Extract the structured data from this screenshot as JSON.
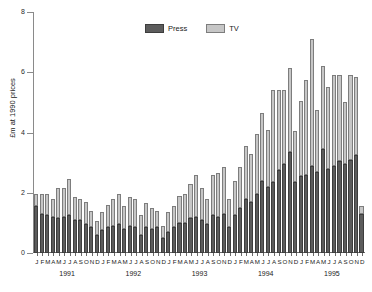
{
  "chart_data": {
    "type": "bar",
    "stacked": true,
    "title": "",
    "xlabel": "",
    "ylabel": "£m at 1990 prices",
    "ylim": [
      0,
      8
    ],
    "yticks": [
      0,
      2,
      4,
      6,
      8
    ],
    "grid": false,
    "legend_position": "top-center",
    "months": [
      "J",
      "F",
      "M",
      "A",
      "M",
      "J",
      "J",
      "A",
      "S",
      "O",
      "N",
      "D"
    ],
    "years": [
      "1991",
      "1992",
      "1993",
      "1994",
      "1995"
    ],
    "categories": [
      "1991-J",
      "1991-F",
      "1991-M",
      "1991-A",
      "1991-M",
      "1991-J",
      "1991-J",
      "1991-A",
      "1991-S",
      "1991-O",
      "1991-N",
      "1991-D",
      "1992-J",
      "1992-F",
      "1992-M",
      "1992-A",
      "1992-M",
      "1992-J",
      "1992-J",
      "1992-A",
      "1992-S",
      "1992-O",
      "1992-N",
      "1992-D",
      "1993-J",
      "1993-F",
      "1993-M",
      "1993-A",
      "1993-M",
      "1993-J",
      "1993-J",
      "1993-A",
      "1993-S",
      "1993-O",
      "1993-N",
      "1993-D",
      "1994-J",
      "1994-F",
      "1994-M",
      "1994-A",
      "1994-M",
      "1994-J",
      "1994-J",
      "1994-A",
      "1994-S",
      "1994-O",
      "1994-N",
      "1994-D",
      "1995-J",
      "1995-F",
      "1995-M",
      "1995-A",
      "1995-M",
      "1995-J",
      "1995-J",
      "1995-A",
      "1995-S",
      "1995-O",
      "1995-N",
      "1995-D"
    ],
    "series": [
      {
        "name": "Press",
        "color": "#5c5c5c",
        "values": [
          1.55,
          1.3,
          1.25,
          1.2,
          1.15,
          1.2,
          1.25,
          1.1,
          1.1,
          0.95,
          0.85,
          0.6,
          0.75,
          0.85,
          0.9,
          0.95,
          0.8,
          0.9,
          0.85,
          0.6,
          0.85,
          0.8,
          0.85,
          0.5,
          0.7,
          0.85,
          1.0,
          1.0,
          1.15,
          1.2,
          1.1,
          0.95,
          1.25,
          1.2,
          1.3,
          0.85,
          1.25,
          1.5,
          1.8,
          1.7,
          1.95,
          2.4,
          2.2,
          2.35,
          2.75,
          2.95,
          3.35,
          2.35,
          2.55,
          2.6,
          2.9,
          2.7,
          3.45,
          2.8,
          2.9,
          3.05,
          2.95,
          3.1,
          3.25,
          1.3
        ]
      },
      {
        "name": "TV",
        "color": "#c6c6c6",
        "values": [
          0.4,
          0.65,
          0.7,
          0.6,
          1.0,
          0.95,
          1.2,
          0.75,
          0.7,
          0.75,
          0.55,
          0.45,
          0.6,
          0.75,
          0.9,
          1.0,
          0.75,
          0.95,
          0.95,
          0.65,
          0.8,
          0.7,
          0.55,
          0.4,
          0.65,
          0.7,
          0.9,
          0.95,
          1.15,
          1.4,
          1.05,
          0.85,
          1.35,
          1.45,
          1.55,
          0.95,
          1.15,
          1.35,
          1.75,
          1.6,
          2.0,
          2.25,
          1.9,
          3.05,
          2.65,
          2.45,
          2.8,
          1.7,
          2.5,
          3.15,
          4.2,
          2.05,
          2.75,
          2.7,
          3.0,
          2.85,
          2.05,
          2.8,
          2.6,
          0.25
        ]
      }
    ]
  },
  "legend": {
    "items": [
      {
        "label": "Press"
      },
      {
        "label": "TV"
      }
    ]
  }
}
